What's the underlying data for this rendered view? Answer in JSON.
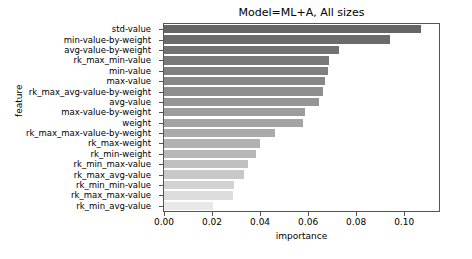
{
  "chart_data": {
    "type": "bar",
    "orientation": "horizontal",
    "title": "Model=ML+A, All sizes",
    "xlabel": "importance",
    "ylabel": "feature",
    "xlim": [
      0.0,
      0.1145
    ],
    "grid": false,
    "legend": null,
    "xticks": [
      0.0,
      0.02,
      0.04,
      0.06,
      0.08,
      0.1
    ],
    "xtick_labels": [
      "0.00",
      "0.02",
      "0.04",
      "0.06",
      "0.08",
      "0.10"
    ],
    "categories": [
      "std-value",
      "min-value-by-weight",
      "avg-value-by-weight",
      "rk_max_min-value",
      "min-value",
      "max-value",
      "rk_max_avg-value-by-weight",
      "avg-value",
      "max-value-by-weight",
      "weight",
      "rk_max_max-value-by-weight",
      "rk_max-weight",
      "rk_min-weight",
      "rk_min_max-value",
      "rk_max_avg-value",
      "rk_min_min-value",
      "rk_max_max-value",
      "rk_min_avg-value"
    ],
    "values": [
      0.1072,
      0.0941,
      0.0729,
      0.0689,
      0.0683,
      0.0671,
      0.0664,
      0.0646,
      0.0588,
      0.0578,
      0.0462,
      0.0398,
      0.0384,
      0.0348,
      0.0334,
      0.0293,
      0.0289,
      0.0203
    ],
    "bar_colors": [
      "#656565",
      "#6b6b6b",
      "#727272",
      "#797979",
      "#808080",
      "#878787",
      "#8e8e8e",
      "#959595",
      "#9c9c9c",
      "#a3a3a3",
      "#aaaaaa",
      "#b1b1b1",
      "#b8b8b8",
      "#c0c0c0",
      "#c8c8c8",
      "#d2d2d2",
      "#dcdcdc",
      "#e8e8e8"
    ]
  }
}
